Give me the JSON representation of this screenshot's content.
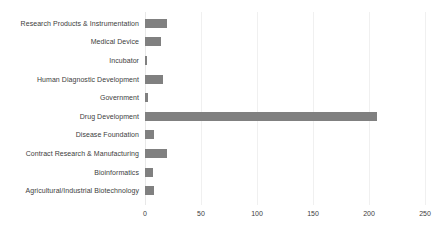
{
  "chart_data": {
    "type": "bar",
    "orientation": "horizontal",
    "title": "",
    "subtitle": "",
    "xlabel": "",
    "ylabel": "",
    "xlim": [
      0,
      250
    ],
    "xticks": [
      0,
      50,
      100,
      150,
      200,
      250
    ],
    "xtick_labels": [
      "0",
      "50",
      "100",
      "150",
      "200",
      "250"
    ],
    "grid": true,
    "legend": false,
    "bar_color": "#808080",
    "background_color": "#ffffff",
    "gridline_color": "#f0f0f0",
    "label_color": "#3d3d3d",
    "categories": [
      "Research Products & Instrumentation",
      "Medical Device",
      "Incubator",
      "Human Diagnostic Development",
      "Government",
      "Drug Development",
      "Disease Foundation",
      "Contract Research & Manufacturing",
      "Bioinformatics",
      "Agricultural/Industrial Biotechnology"
    ],
    "values": [
      20,
      14,
      2,
      16,
      3,
      207,
      8,
      20,
      7,
      8
    ]
  }
}
